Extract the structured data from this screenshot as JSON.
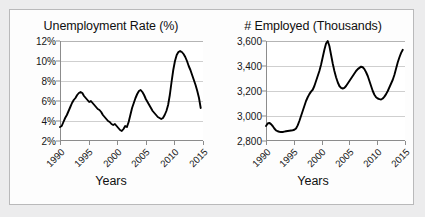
{
  "panel": {
    "background": "#fdfdfd",
    "border_color": "#b9b9ba",
    "outer_background": "#ececed"
  },
  "charts": [
    {
      "id": "unemployment-rate",
      "title": "Unemployment Rate (%)",
      "xlabel": "Years",
      "y_ticks": [
        "2%",
        "4%",
        "6%",
        "8%",
        "10%",
        "12%"
      ],
      "x_ticks": [
        "1990",
        "1995",
        "2000",
        "2005",
        "2010",
        "2015"
      ]
    },
    {
      "id": "number-employed",
      "title": "# Employed (Thousands)",
      "xlabel": "Years",
      "y_ticks": [
        "2,800",
        "3,000",
        "3,200",
        "3,400",
        "3,600"
      ],
      "x_ticks": [
        "1990",
        "1995",
        "2000",
        "2005",
        "2010",
        "2015"
      ]
    }
  ],
  "chart_data": [
    {
      "type": "line",
      "title": "Unemployment Rate (%)",
      "xlabel": "Years",
      "ylabel": "",
      "xlim": [
        1990,
        2015
      ],
      "ylim": [
        2,
        12
      ],
      "grid": true,
      "legend": "none",
      "line_color": "#000000",
      "ytick_labels": [
        "2%",
        "4%",
        "6%",
        "8%",
        "10%",
        "12%"
      ],
      "ytick_values": [
        2,
        4,
        6,
        8,
        10,
        12
      ],
      "xtick_values": [
        1990,
        1995,
        2000,
        2005,
        2010,
        2015
      ],
      "x": [
        1990.0,
        1990.3,
        1990.6,
        1990.9,
        1991.2,
        1991.5,
        1991.8,
        1992.1,
        1992.4,
        1992.7,
        1993.0,
        1993.3,
        1993.6,
        1993.9,
        1994.2,
        1994.5,
        1994.8,
        1995.1,
        1995.4,
        1995.7,
        1996.0,
        1996.3,
        1996.6,
        1996.9,
        1997.2,
        1997.5,
        1997.8,
        1998.1,
        1998.4,
        1998.7,
        1999.0,
        1999.3,
        1999.6,
        1999.9,
        2000.2,
        2000.5,
        2000.8,
        2001.1,
        2001.4,
        2001.7,
        2002.0,
        2002.3,
        2002.6,
        2002.9,
        2003.2,
        2003.5,
        2003.8,
        2004.1,
        2004.4,
        2004.7,
        2005.0,
        2005.3,
        2005.6,
        2005.9,
        2006.2,
        2006.5,
        2006.8,
        2007.1,
        2007.4,
        2007.7,
        2008.0,
        2008.3,
        2008.6,
        2008.9,
        2009.2,
        2009.5,
        2009.8,
        2010.1,
        2010.4,
        2010.7,
        2011.0,
        2011.3,
        2011.6,
        2011.9,
        2012.2,
        2012.5,
        2012.8,
        2013.1,
        2013.4,
        2013.7,
        2014.0,
        2014.3,
        2014.6
      ],
      "y": [
        3.4,
        3.5,
        3.9,
        4.3,
        4.6,
        5.0,
        5.4,
        5.8,
        6.1,
        6.3,
        6.6,
        6.8,
        6.9,
        6.8,
        6.5,
        6.3,
        6.1,
        5.9,
        6.0,
        5.8,
        5.6,
        5.4,
        5.2,
        5.1,
        4.9,
        4.6,
        4.4,
        4.2,
        4.0,
        3.9,
        3.7,
        3.6,
        3.7,
        3.5,
        3.3,
        3.1,
        3.0,
        3.2,
        3.5,
        3.4,
        3.9,
        4.6,
        5.3,
        5.8,
        6.3,
        6.7,
        7.0,
        7.1,
        6.9,
        6.6,
        6.2,
        5.9,
        5.6,
        5.3,
        5.0,
        4.8,
        4.6,
        4.4,
        4.3,
        4.2,
        4.3,
        4.6,
        5.0,
        5.6,
        6.6,
        7.9,
        9.1,
        10.0,
        10.6,
        10.9,
        11.0,
        10.9,
        10.7,
        10.4,
        10.0,
        9.5,
        9.1,
        8.6,
        8.1,
        7.6,
        7.0,
        6.3,
        5.3
      ]
    },
    {
      "type": "line",
      "title": "# Employed (Thousands)",
      "xlabel": "Years",
      "ylabel": "",
      "xlim": [
        1990,
        2015
      ],
      "ylim": [
        2800,
        3600
      ],
      "grid": true,
      "legend": "none",
      "line_color": "#000000",
      "ytick_labels": [
        "2,800",
        "3,000",
        "3,200",
        "3,400",
        "3,600"
      ],
      "ytick_values": [
        2800,
        3000,
        3200,
        3400,
        3600
      ],
      "xtick_values": [
        1990,
        1995,
        2000,
        2005,
        2010,
        2015
      ],
      "x": [
        1990.0,
        1990.3,
        1990.6,
        1990.9,
        1991.2,
        1991.5,
        1991.8,
        1992.1,
        1992.4,
        1992.7,
        1993.0,
        1993.3,
        1993.6,
        1993.9,
        1994.2,
        1994.5,
        1994.8,
        1995.1,
        1995.4,
        1995.7,
        1996.0,
        1996.3,
        1996.6,
        1996.9,
        1997.2,
        1997.5,
        1997.8,
        1998.1,
        1998.4,
        1998.7,
        1999.0,
        1999.3,
        1999.6,
        1999.9,
        2000.2,
        2000.5,
        2000.8,
        2001.1,
        2001.4,
        2001.7,
        2002.0,
        2002.3,
        2002.6,
        2002.9,
        2003.2,
        2003.5,
        2003.8,
        2004.1,
        2004.4,
        2004.7,
        2005.0,
        2005.3,
        2005.6,
        2005.9,
        2006.2,
        2006.5,
        2006.8,
        2007.1,
        2007.4,
        2007.7,
        2008.0,
        2008.3,
        2008.6,
        2008.9,
        2009.2,
        2009.5,
        2009.8,
        2010.1,
        2010.4,
        2010.7,
        2011.0,
        2011.3,
        2011.6,
        2011.9,
        2012.2,
        2012.5,
        2012.8,
        2013.1,
        2013.4,
        2013.7,
        2014.0,
        2014.3,
        2014.6
      ],
      "y": [
        2920,
        2940,
        2945,
        2935,
        2920,
        2900,
        2885,
        2878,
        2874,
        2872,
        2872,
        2875,
        2878,
        2880,
        2882,
        2884,
        2886,
        2890,
        2900,
        2925,
        2960,
        3000,
        3040,
        3080,
        3120,
        3150,
        3175,
        3195,
        3210,
        3240,
        3280,
        3320,
        3360,
        3410,
        3470,
        3530,
        3580,
        3600,
        3560,
        3490,
        3420,
        3360,
        3310,
        3270,
        3240,
        3225,
        3220,
        3225,
        3240,
        3260,
        3280,
        3300,
        3320,
        3340,
        3360,
        3375,
        3385,
        3395,
        3390,
        3375,
        3350,
        3320,
        3280,
        3240,
        3200,
        3170,
        3150,
        3140,
        3135,
        3132,
        3140,
        3155,
        3175,
        3200,
        3230,
        3260,
        3290,
        3330,
        3380,
        3430,
        3470,
        3505,
        3530
      ]
    }
  ]
}
